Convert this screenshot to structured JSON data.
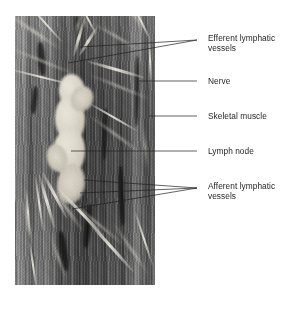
{
  "figure": {
    "type": "labeled-photomicrograph",
    "photo": {
      "alt_name": "lymph-node-micrograph",
      "description": "Grayscale photomicrograph of a lymph node embedded among skeletal muscle fibers with lymphatic vessels and a nerve"
    },
    "labels": [
      {
        "id": "efferent-lymphatic-vessels",
        "text": "Efferent lymphatic\nvessels",
        "line1": "Efferent lymphatic",
        "line2": "vessels",
        "x": 208,
        "y": 33,
        "leader_count": 2
      },
      {
        "id": "nerve",
        "text": "Nerve",
        "line1": "Nerve",
        "line2": "",
        "x": 208,
        "y": 76,
        "leader_count": 1
      },
      {
        "id": "skeletal-muscle",
        "text": "Skeletal muscle",
        "line1": "Skeletal muscle",
        "line2": "",
        "x": 208,
        "y": 111,
        "leader_count": 1
      },
      {
        "id": "lymph-node",
        "text": "Lymph node",
        "line1": "Lymph node",
        "line2": "",
        "x": 208,
        "y": 146,
        "leader_count": 1
      },
      {
        "id": "afferent-lymphatic-vessels",
        "text": "Afferent lymphatic\nvessels",
        "line1": "Afferent lymphatic",
        "line2": "vessels",
        "x": 208,
        "y": 181,
        "leader_count": 3
      }
    ],
    "colors": {
      "text": "#231f20",
      "leader_line": "#231f20",
      "background": "#ffffff"
    }
  }
}
